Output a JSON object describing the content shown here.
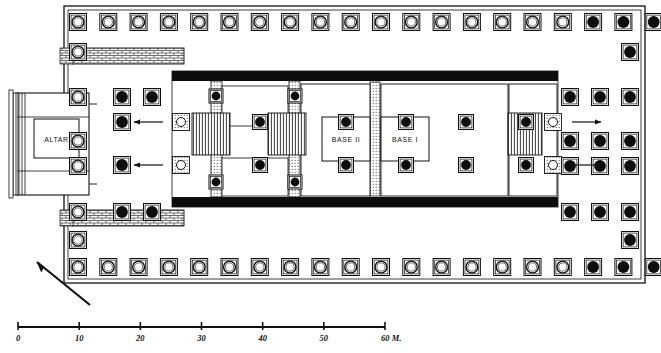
{
  "figure": {
    "type": "architectural-floor-plan",
    "title": "",
    "north_arrow": {
      "name": "north-arrow",
      "direction": "up-left"
    }
  },
  "labels": {
    "altar": "ALTAR",
    "base_ii": "BASE II",
    "base_i": "BASE I"
  },
  "scale_bar": {
    "name": "scale-bar",
    "unit_suffix": "M.",
    "ticks": [
      "0",
      "10",
      "20",
      "30",
      "40",
      "50",
      "60"
    ],
    "tick_values": [
      0,
      10,
      20,
      30,
      40,
      50,
      60
    ],
    "x_start_px": 18,
    "x_end_px": 385
  },
  "colors": {
    "ink": "#111111",
    "wall_fill": "#0d0d0d",
    "paper": "#ffffff",
    "hatch": "#333333"
  },
  "plan": {
    "platform": {
      "x": 64,
      "y": 6,
      "w": 581,
      "h": 277
    },
    "peristyle": {
      "column_pitch_x": 30.3,
      "column_size": 17,
      "top_row_y": 22,
      "bottom_row_y": 267,
      "top_row_count": 20,
      "bottom_row_count": 20,
      "solid_from_index": 17,
      "left_col_x": 78,
      "right_col_x": 630
    },
    "cella": {
      "x": 172,
      "y": 72,
      "w": 386,
      "h": 135
    },
    "north_wall": {
      "x": 172,
      "y": 72,
      "w": 386,
      "h": 9
    },
    "south_wall": {
      "x": 172,
      "y": 198,
      "w": 386,
      "h": 9
    },
    "cross_wall_a": {
      "x": 212,
      "y": 81,
      "w": 10,
      "h": 117
    },
    "cross_wall_b": {
      "x": 290,
      "y": 81,
      "w": 10,
      "h": 117
    },
    "base_ii_box": {
      "x": 322,
      "y": 118,
      "w": 48,
      "h": 43
    },
    "base_i_box": {
      "x": 381,
      "y": 118,
      "w": 48,
      "h": 43
    },
    "divider_pier": {
      "x": 371,
      "y": 85,
      "w": 9,
      "h": 110
    },
    "altar_block": {
      "x": 18,
      "y": 94,
      "w": 70,
      "h": 100
    },
    "altar_inner": {
      "x": 34,
      "y": 120,
      "w": 44,
      "h": 38
    },
    "west_ramp_top": {
      "x": 72,
      "y": 50,
      "w": 110,
      "h": 14
    },
    "west_ramp_bottom": {
      "x": 72,
      "y": 211,
      "w": 110,
      "h": 14
    }
  },
  "arrows": {
    "west": [
      {
        "name": "entry-arrow-west-upper",
        "x1": 163,
        "y1": 122,
        "x2": 134,
        "y2": 122
      },
      {
        "name": "entry-arrow-west-lower",
        "x1": 163,
        "y1": 165,
        "x2": 134,
        "y2": 165
      }
    ],
    "east": [
      {
        "name": "entry-arrow-east-upper",
        "x1": 572,
        "y1": 122,
        "x2": 601,
        "y2": 122
      },
      {
        "name": "entry-arrow-east-lower",
        "x1": 572,
        "y1": 165,
        "x2": 601,
        "y2": 165
      }
    ]
  },
  "column_groups": [
    {
      "name": "interior-columns-north",
      "y": 122,
      "xs": [
        346,
        406,
        466,
        526
      ],
      "style": "solid"
    },
    {
      "name": "interior-columns-south",
      "y": 165,
      "xs": [
        346,
        406,
        466,
        526
      ],
      "style": "solid"
    },
    {
      "name": "pronaos-columns-north",
      "y": 122,
      "xs": [
        260
      ],
      "style": "solid"
    },
    {
      "name": "pronaos-columns-south",
      "y": 165,
      "xs": [
        260
      ],
      "style": "solid"
    }
  ]
}
